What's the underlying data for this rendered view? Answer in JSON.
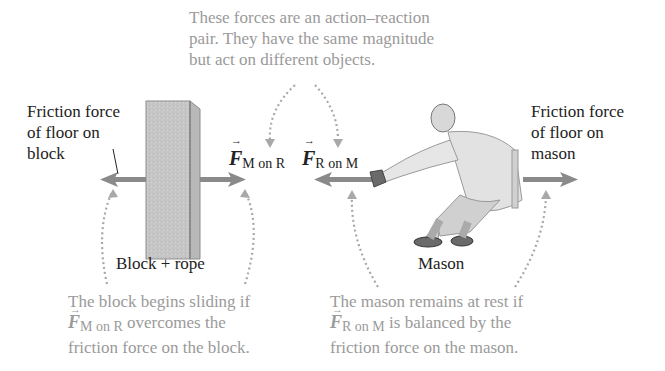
{
  "callouts": {
    "top": {
      "lines": [
        "These forces are an action–reaction",
        "pair. They have the same magnitude",
        "but act on different objects."
      ]
    },
    "bottom_left": {
      "line1": "The block begins sliding if",
      "vector": "F",
      "vector_sub": "M on R",
      "line2_rest": " overcomes the",
      "line3": "friction force on the block."
    },
    "bottom_right": {
      "line1": "The mason remains at rest if",
      "vector": "F",
      "vector_sub": "R on M",
      "line2_rest": " is balanced by the",
      "line3": "friction force on the mason."
    }
  },
  "labels": {
    "friction_block": [
      "Friction force",
      "of floor on",
      "block"
    ],
    "friction_mason": [
      "Friction force",
      "of floor on",
      "mason"
    ],
    "f_m_on_r": {
      "symbol": "F",
      "sub": "M on R"
    },
    "f_r_on_m": {
      "symbol": "F",
      "sub": "R on M"
    },
    "block_rope": "Block + rope",
    "mason": "Mason"
  },
  "colors": {
    "arrow": "#8a8a8a",
    "dotted": "#a8a8a8",
    "block": "#c4c4c4",
    "annotation_text": "#9a9a9a",
    "label_text": "#222222"
  }
}
